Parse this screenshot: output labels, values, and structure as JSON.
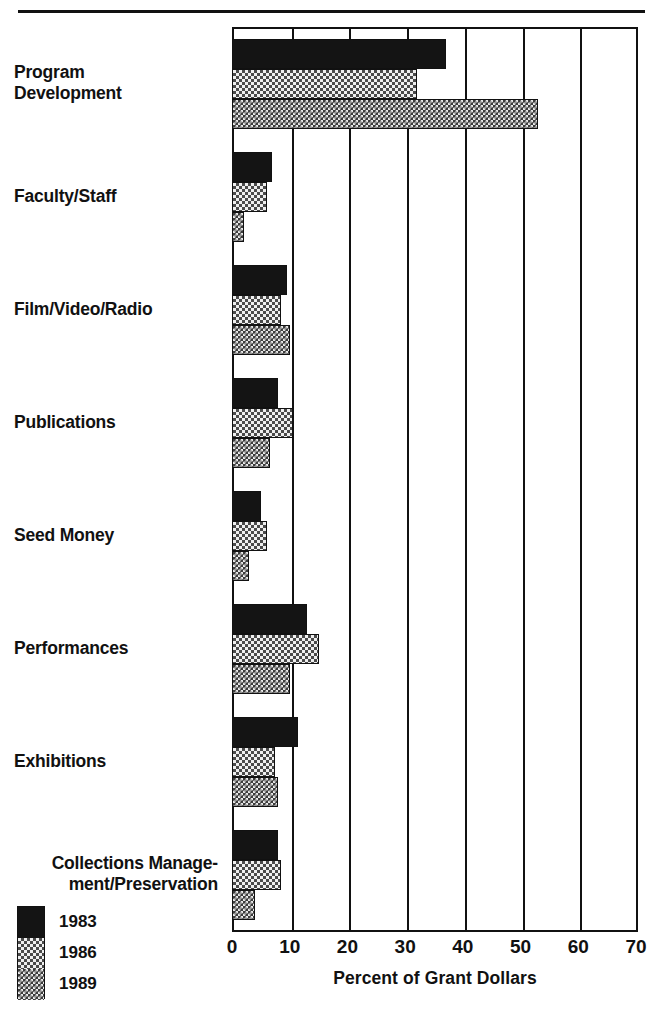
{
  "chart_data": {
    "type": "bar",
    "orientation": "horizontal",
    "title": "",
    "xlabel": "Percent of Grant Dollars",
    "ylabel": "",
    "xlim": [
      0,
      70
    ],
    "xticks": [
      "0",
      "10",
      "20",
      "30",
      "40",
      "50",
      "60",
      "70"
    ],
    "xtick_values": [
      0,
      10,
      20,
      30,
      40,
      50,
      60,
      70
    ],
    "grid": true,
    "legend_position": "bottom-left",
    "categories": [
      "Program Development",
      "Faculty/Staff",
      "Film/Video/Radio",
      "Publications",
      "Seed Money",
      "Performances",
      "Exhibitions",
      "Collections Management/Preservation"
    ],
    "series": [
      {
        "name": "1983",
        "values": [
          37,
          7,
          9.5,
          8,
          5,
          13,
          11.5,
          8
        ]
      },
      {
        "name": "1986",
        "values": [
          32,
          6,
          8.5,
          10.5,
          6,
          15,
          7.5,
          8.5
        ]
      },
      {
        "name": "1989",
        "values": [
          53,
          2,
          10,
          6.5,
          3,
          10,
          8,
          4
        ]
      }
    ]
  },
  "axis": {
    "title": "Percent of  Grant Dollars",
    "ticks": [
      "0",
      "10",
      "20",
      "30",
      "40",
      "50",
      "60",
      "70"
    ]
  },
  "categories": [
    {
      "line1": "Program",
      "line2": "Development"
    },
    {
      "line1": "Faculty/Staff",
      "line2": ""
    },
    {
      "line1": "Film/Video/Radio",
      "line2": ""
    },
    {
      "line1": "Publications",
      "line2": ""
    },
    {
      "line1": "Seed Money",
      "line2": ""
    },
    {
      "line1": "Performances",
      "line2": ""
    },
    {
      "line1": "Exhibitions",
      "line2": ""
    },
    {
      "line1": "Collections Manage-",
      "line2": "ment/Preservation"
    }
  ],
  "legend": {
    "items": [
      {
        "label": "1983",
        "pattern": "solid-black",
        "color": "#141414"
      },
      {
        "label": "1986",
        "pattern": "light-checker",
        "color": "#efefef"
      },
      {
        "label": "1989",
        "pattern": "dark-checker",
        "color": "#3c3c3c"
      }
    ]
  }
}
